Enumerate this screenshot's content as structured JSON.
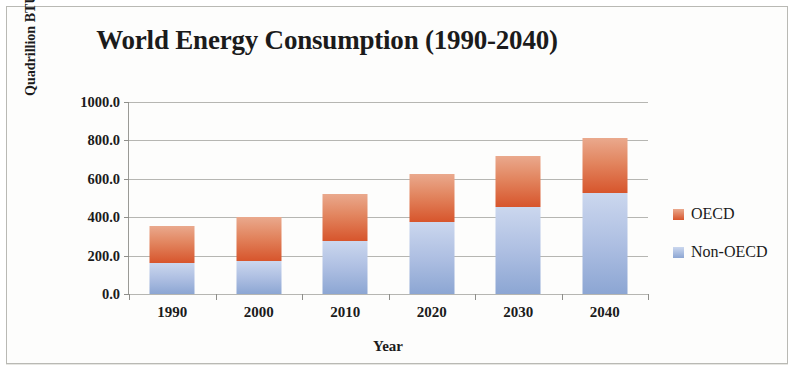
{
  "chart_data": {
    "type": "bar",
    "subtype": "stacked-column",
    "title": "World Energy Consumption (1990-2040)",
    "xlabel": "Year",
    "ylabel": "Quadrillion BTUs",
    "categories": [
      "1990",
      "2000",
      "2010",
      "2020",
      "2030",
      "2040"
    ],
    "series": [
      {
        "name": "Non-OECD",
        "color": "#8ca6d3",
        "values": [
          160,
          170,
          275,
          375,
          455,
          525
        ]
      },
      {
        "name": "OECD",
        "color": "#d7552c",
        "values": [
          195,
          230,
          245,
          250,
          265,
          290
        ]
      }
    ],
    "stack_totals": [
      355,
      400,
      520,
      625,
      720,
      815
    ],
    "ylim": [
      0,
      1000
    ],
    "ytick_labels": [
      "1000.0",
      "800.0",
      "600.0",
      "400.0",
      "200.0",
      "0.0"
    ],
    "ytick_values": [
      1000,
      800,
      600,
      400,
      200,
      0
    ],
    "grid": true,
    "legend_position": "right",
    "legend": [
      {
        "label": "OECD",
        "swatch": "oecd"
      },
      {
        "label": "Non-OECD",
        "swatch": "nonoecd"
      }
    ]
  }
}
